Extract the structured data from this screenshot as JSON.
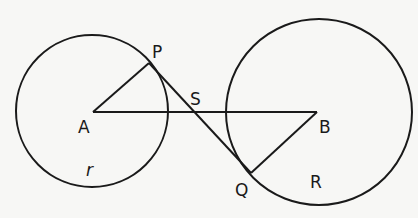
{
  "diagram": {
    "colors": {
      "stroke": "#1a1a1a",
      "background": "#f7f7f5"
    },
    "circles": [
      {
        "name": "circle-A",
        "cx": 92,
        "cy": 111,
        "r": 76,
        "radius_label": "r"
      },
      {
        "name": "circle-B",
        "cx": 319,
        "cy": 112,
        "r": 93,
        "radius_label": "R"
      }
    ],
    "points": {
      "A": {
        "x": 93,
        "y": 112
      },
      "B": {
        "x": 317,
        "y": 112
      },
      "P": {
        "x": 149,
        "y": 63
      },
      "Q": {
        "x": 251,
        "y": 173
      }
    },
    "labels": {
      "P": "P",
      "S": "S",
      "A": "A",
      "r": "r",
      "B": "B",
      "Q": "Q",
      "R": "R"
    }
  }
}
